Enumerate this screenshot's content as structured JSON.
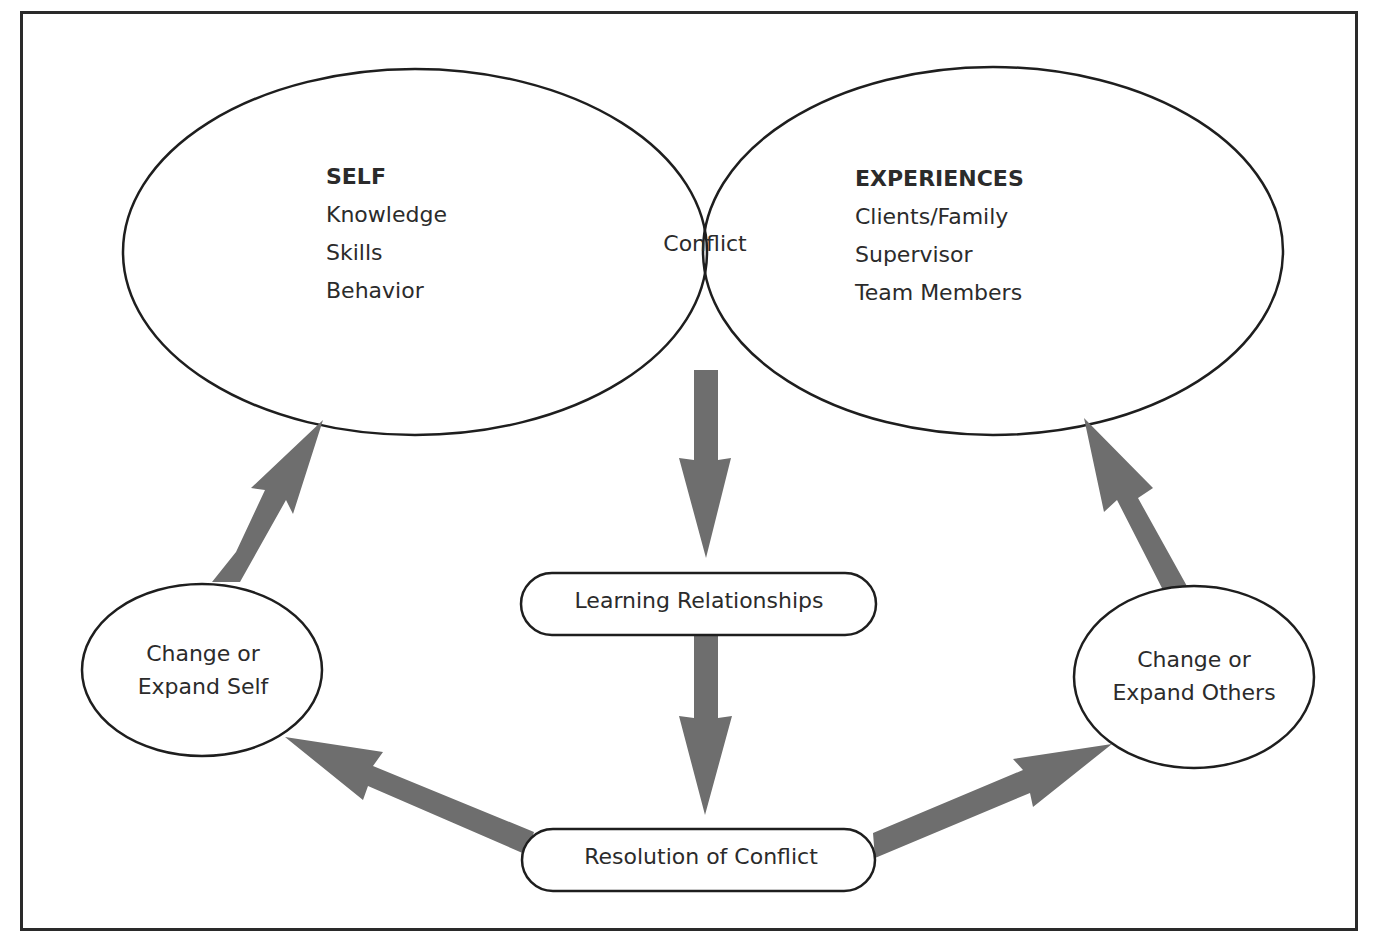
{
  "diagram": {
    "self": {
      "heading": "SELF",
      "items": [
        "Knowledge",
        "Skills",
        "Behavior"
      ]
    },
    "experiences": {
      "heading": "EXPERIENCES",
      "items": [
        "Clients/Family",
        "Supervisor",
        "Team Members"
      ]
    },
    "intersection": "Conflict",
    "learning": "Learning Relationships",
    "resolution": "Resolution of Conflict",
    "change_self": [
      "Change or",
      "Expand Self"
    ],
    "change_others": [
      "Change or",
      "Expand Others"
    ],
    "colors": {
      "stroke": "#1e1e1e",
      "arrow": "#6e6e6e",
      "text": "#2b2b2b",
      "background": "#ffffff"
    },
    "arrows": [
      {
        "from": "Conflict",
        "to": "Learning Relationships"
      },
      {
        "from": "Learning Relationships",
        "to": "Resolution of Conflict"
      },
      {
        "from": "Resolution of Conflict",
        "to": "Change or Expand Self"
      },
      {
        "from": "Resolution of Conflict",
        "to": "Change or Expand Others"
      },
      {
        "from": "Change or Expand Self",
        "to": "SELF"
      },
      {
        "from": "Change or Expand Others",
        "to": "EXPERIENCES"
      }
    ]
  }
}
